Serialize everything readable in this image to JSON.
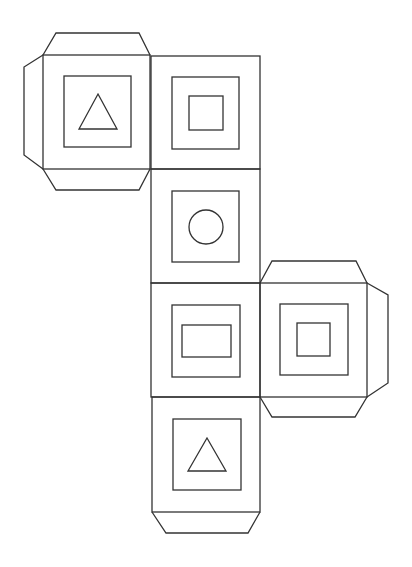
{
  "diagram": {
    "title": "",
    "type": "cube-net",
    "stroke_color": "#333333",
    "background": "#ffffff",
    "stroke_width": 1.3,
    "faces": [
      {
        "id": "face-top-left",
        "symbol": "triangle",
        "outer": {
          "x": 43,
          "y": 55,
          "w": 107,
          "h": 114
        },
        "inner": {
          "x": 64,
          "y": 76,
          "w": 67,
          "h": 71
        },
        "shape_points": "98,94 117,129 79,129",
        "flaps": [
          {
            "side": "top",
            "points": "43,55 56,33 139,33 150,55"
          },
          {
            "side": "bottom",
            "points": "43,169 56,190 139,190 150,169"
          },
          {
            "side": "left",
            "points": "43,55 24,67 24,155 43,169"
          }
        ]
      },
      {
        "id": "face-column-1",
        "symbol": "square",
        "outer": {
          "x": 151,
          "y": 56,
          "w": 109,
          "h": 113
        },
        "inner": {
          "x": 172,
          "y": 77,
          "w": 67,
          "h": 72
        },
        "shape_rect": {
          "x": 189,
          "y": 96,
          "w": 34,
          "h": 34
        },
        "flaps": []
      },
      {
        "id": "face-column-2",
        "symbol": "circle",
        "outer": {
          "x": 151,
          "y": 169,
          "w": 109,
          "h": 114
        },
        "inner": {
          "x": 172,
          "y": 191,
          "w": 67,
          "h": 71
        },
        "shape_circle": {
          "cx": 206,
          "cy": 227,
          "r": 17
        },
        "flaps": []
      },
      {
        "id": "face-column-3",
        "symbol": "rectangle",
        "outer": {
          "x": 151,
          "y": 283,
          "w": 109,
          "h": 114
        },
        "inner": {
          "x": 172,
          "y": 305,
          "w": 68,
          "h": 72
        },
        "shape_rect": {
          "x": 182,
          "y": 325,
          "w": 49,
          "h": 32
        },
        "flaps": []
      },
      {
        "id": "face-column-4",
        "symbol": "triangle",
        "outer": {
          "x": 152,
          "y": 397,
          "w": 108,
          "h": 115
        },
        "inner": {
          "x": 173,
          "y": 419,
          "w": 68,
          "h": 71
        },
        "shape_points": "207,438 226,471 188,471",
        "flaps": [
          {
            "side": "bottom",
            "points": "152,512 166,533 248,533 260,512"
          }
        ]
      },
      {
        "id": "face-right",
        "symbol": "square",
        "outer": {
          "x": 260,
          "y": 283,
          "w": 107,
          "h": 114
        },
        "inner": {
          "x": 280,
          "y": 304,
          "w": 68,
          "h": 71
        },
        "shape_rect": {
          "x": 297,
          "y": 323,
          "w": 33,
          "h": 33
        },
        "flaps": [
          {
            "side": "top",
            "points": "260,283 272,261 356,261 367,283"
          },
          {
            "side": "bottom",
            "points": "260,397 272,417 355,417 367,397"
          },
          {
            "side": "right",
            "points": "367,283 388,295 388,383 367,397"
          }
        ]
      }
    ]
  }
}
